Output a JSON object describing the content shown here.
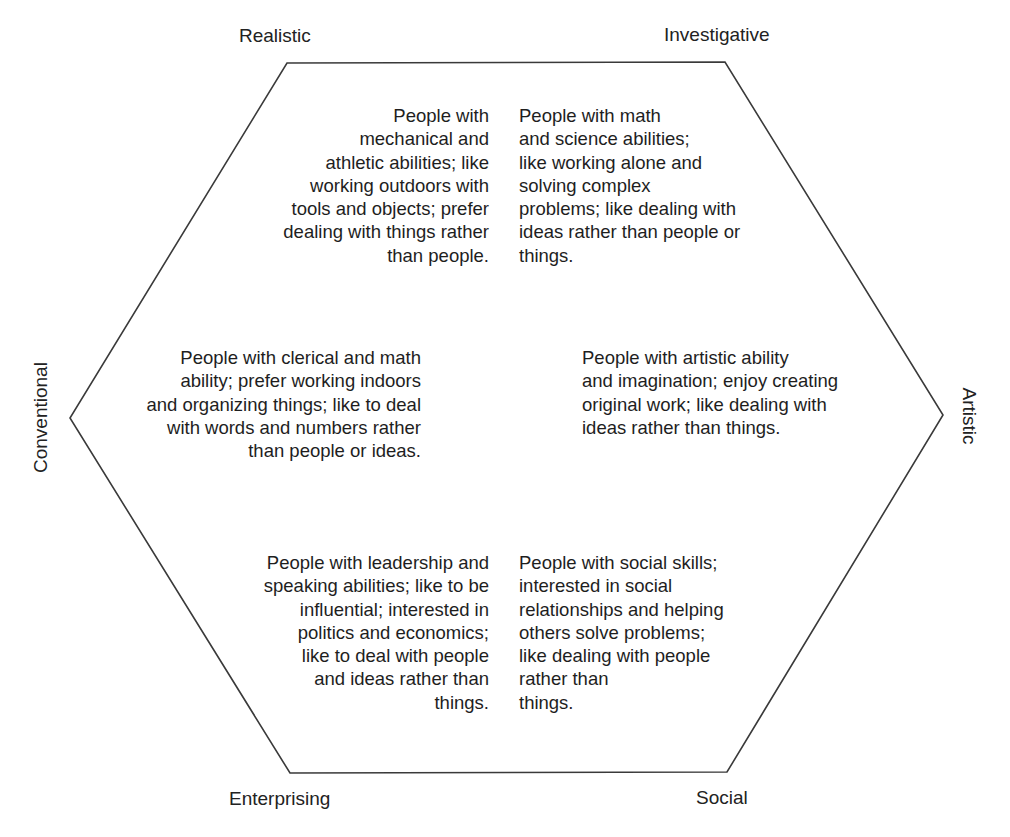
{
  "diagram": {
    "type": "hexagon",
    "stroke_color": "#3a3a3a",
    "background": "#ffffff",
    "vertices": [
      [
        287,
        63
      ],
      [
        725,
        62
      ],
      [
        943,
        415
      ],
      [
        727,
        772
      ],
      [
        290,
        773
      ],
      [
        70,
        418
      ]
    ]
  },
  "labels": {
    "realistic": "Realistic",
    "investigative": "Investigative",
    "artistic": "Artistic",
    "social": "Social",
    "enterprising": "Enterprising",
    "conventional": "Conventional"
  },
  "descriptions": {
    "realistic": {
      "lines": [
        "People with",
        "mechanical and",
        "athletic abilities; like",
        "working outdoors with",
        "tools and objects; prefer",
        "dealing with things rather",
        "than people."
      ]
    },
    "investigative": {
      "lines": [
        "People with math",
        "and science abilities;",
        "like working alone and",
        "solving complex",
        "problems; like dealing with",
        "ideas rather than people or",
        "things."
      ]
    },
    "conventional": {
      "lines": [
        "People with clerical and math",
        "ability; prefer working indoors",
        "and organizing things; like to deal",
        "with words and numbers rather",
        "than people or ideas."
      ]
    },
    "artistic": {
      "lines": [
        "People with artistic ability",
        "and imagination; enjoy creating",
        "original work; like dealing with",
        "ideas rather than things."
      ]
    },
    "enterprising": {
      "lines": [
        "People with leadership and",
        "speaking abilities; like to be",
        "influential; interested in",
        "politics and economics;",
        "like to deal with people",
        "and ideas rather than",
        "things."
      ]
    },
    "social": {
      "lines": [
        "People with social skills;",
        "interested in social",
        "relationships and helping",
        "others solve problems;",
        "like dealing with people",
        "rather than",
        "things."
      ]
    }
  }
}
